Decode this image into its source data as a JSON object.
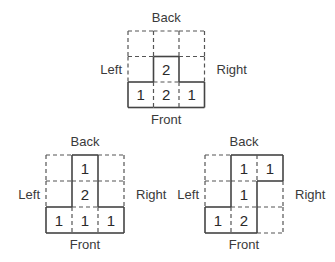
{
  "diagrams": [
    {
      "id": "top",
      "labels": {
        "back": "Back",
        "front": "Front",
        "left": "Left",
        "right": "Right"
      },
      "grid_size": 3,
      "cells": [
        {
          "row": 1,
          "col": 1,
          "value": "2"
        },
        {
          "row": 2,
          "col": 0,
          "value": "1"
        },
        {
          "row": 2,
          "col": 1,
          "value": "2"
        },
        {
          "row": 2,
          "col": 2,
          "value": "1"
        }
      ]
    },
    {
      "id": "bottom-left",
      "labels": {
        "back": "Back",
        "front": "Front",
        "left": "Left",
        "right": "Right"
      },
      "grid_size": 3,
      "cells": [
        {
          "row": 0,
          "col": 1,
          "value": "1"
        },
        {
          "row": 1,
          "col": 1,
          "value": "2"
        },
        {
          "row": 2,
          "col": 0,
          "value": "1"
        },
        {
          "row": 2,
          "col": 1,
          "value": "1"
        },
        {
          "row": 2,
          "col": 2,
          "value": "1"
        }
      ]
    },
    {
      "id": "bottom-right",
      "labels": {
        "back": "Back",
        "front": "Front",
        "left": "Left",
        "right": "Right"
      },
      "grid_size": 3,
      "cells": [
        {
          "row": 0,
          "col": 1,
          "value": "1"
        },
        {
          "row": 0,
          "col": 2,
          "value": "1"
        },
        {
          "row": 1,
          "col": 1,
          "value": "1"
        },
        {
          "row": 2,
          "col": 0,
          "value": "1"
        },
        {
          "row": 2,
          "col": 1,
          "value": "2"
        }
      ]
    }
  ]
}
